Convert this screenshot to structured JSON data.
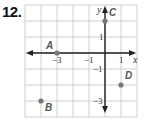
{
  "problem": {
    "number": "12."
  },
  "chart_data": {
    "type": "scatter",
    "title": "",
    "xlabel": "x",
    "ylabel": "y",
    "xlim": [
      -5,
      2
    ],
    "ylim": [
      -4,
      3
    ],
    "grid": true,
    "x_tick_labels": [
      "-3",
      "-1",
      "1"
    ],
    "y_tick_labels": [
      "1",
      "-1",
      "-3"
    ],
    "points": [
      {
        "label": "A",
        "x": -3,
        "y": 0
      },
      {
        "label": "B",
        "x": -4,
        "y": -3
      },
      {
        "label": "C",
        "x": 0,
        "y": 2
      },
      {
        "label": "D",
        "x": 1,
        "y": -2
      }
    ]
  },
  "colors": {
    "grid": "#cfcfcf",
    "axis": "#222222",
    "point": "#777777"
  }
}
